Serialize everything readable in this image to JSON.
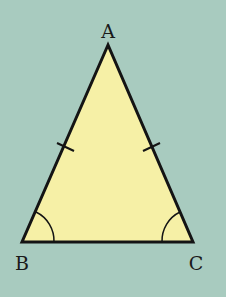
{
  "diagram": {
    "type": "isosceles-triangle",
    "colors": {
      "background": "#a8cbbf",
      "fill": "#f6f0a6",
      "stroke": "#141414"
    },
    "vertices": [
      {
        "label": "A",
        "x": 108,
        "y": 45
      },
      {
        "label": "B",
        "x": 22,
        "y": 242
      },
      {
        "label": "C",
        "x": 193,
        "y": 242
      }
    ],
    "equal_sides": [
      "AB",
      "AC"
    ],
    "equal_angles": [
      "B",
      "C"
    ]
  }
}
